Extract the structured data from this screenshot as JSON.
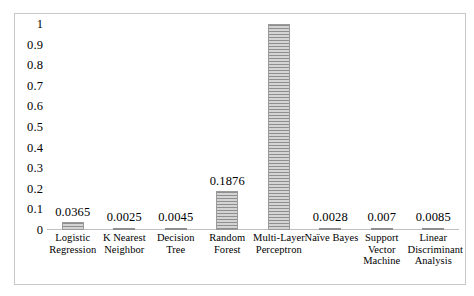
{
  "chart_data": {
    "type": "bar",
    "title": "",
    "xlabel": "",
    "ylabel": "",
    "ylim": [
      0,
      1
    ],
    "grid": false,
    "legend": false,
    "categories": [
      "Logistic Regression",
      "K Nearest Neighbor",
      "Decision Tree",
      "Random Forest",
      "Multi-Layer Perceptron",
      "Naïve Bayes",
      "Support Vector Machine",
      "Linear Discriminant Analysis"
    ],
    "category_lines": [
      [
        "Logistic",
        "Regression"
      ],
      [
        "K Nearest",
        "Neighbor"
      ],
      [
        "Decision",
        "Tree"
      ],
      [
        "Random",
        "Forest"
      ],
      [
        "Multi-Layer",
        "Perceptron"
      ],
      [
        "Naïve Bayes"
      ],
      [
        "Support",
        "Vector",
        "Machine"
      ],
      [
        "Linear",
        "Discriminant",
        "Analysis"
      ]
    ],
    "values": [
      0.0365,
      0.0025,
      0.0045,
      0.1876,
      1,
      0.0028,
      0.007,
      0.0085
    ],
    "value_labels": [
      "0.0365",
      "0.0025",
      "0.0045",
      "0.1876",
      "",
      "0.0028",
      "0.007",
      "0.0085"
    ],
    "y_ticks": [
      1,
      0.9,
      0.8,
      0.7,
      0.6,
      0.5,
      0.4,
      0.3,
      0.2,
      0.1,
      0
    ],
    "y_tick_labels": [
      "1",
      "0.9",
      "0.8",
      "0.7",
      "0.6",
      "0.5",
      "0.4",
      "0.3",
      "0.2",
      "0.1",
      "0"
    ],
    "bar_color": "#a6a6a6",
    "bar_pattern": "horizontal-stripes",
    "axis_color": "#bfbfbf",
    "border_color": "#c8c8c8"
  }
}
